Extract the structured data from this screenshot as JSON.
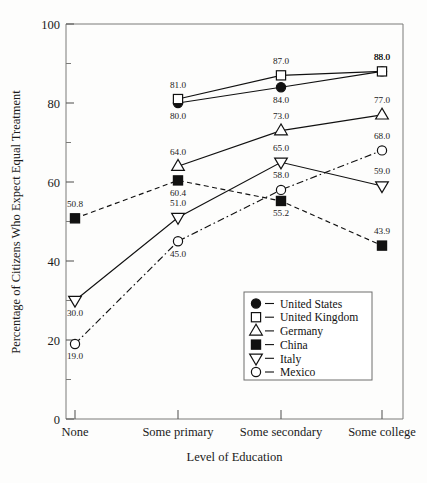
{
  "chart_data": {
    "type": "line",
    "title": "",
    "xlabel": "Level of Education",
    "ylabel": "Percentage of Citizens Who Expect Equal Treatment",
    "categories": [
      "None",
      "Some primary",
      "Some secondary",
      "Some college"
    ],
    "ylim": [
      0,
      100
    ],
    "yticks": [
      0,
      20,
      40,
      60,
      80,
      100
    ],
    "yticks_minor": [
      10,
      30,
      50,
      70,
      90
    ],
    "grid": false,
    "legend_position": "center-right-inside",
    "series": [
      {
        "name": "United States",
        "marker": "filled-circle",
        "line_style": "solid",
        "values": [
          null,
          80.0,
          84.0,
          88.0
        ],
        "labels": [
          "",
          "80.0",
          "84.0",
          "88.0"
        ],
        "label_positions": [
          "",
          "below",
          "below",
          "above"
        ]
      },
      {
        "name": "United Kingdom",
        "marker": "open-square",
        "line_style": "solid",
        "values": [
          null,
          81.0,
          87.0,
          88.0
        ],
        "labels": [
          "",
          "81.0",
          "87.0",
          "88.0"
        ],
        "label_positions": [
          "",
          "above",
          "above",
          "above"
        ]
      },
      {
        "name": "Germany",
        "marker": "open-triangle-up",
        "line_style": "solid",
        "values": [
          null,
          64.0,
          73.0,
          77.0
        ],
        "labels": [
          "",
          "64.0",
          "73.0",
          "77.0"
        ],
        "label_positions": [
          "",
          "above",
          "above",
          "above"
        ]
      },
      {
        "name": "China",
        "marker": "filled-square",
        "line_style": "dashed",
        "values": [
          50.8,
          60.4,
          55.2,
          43.9
        ],
        "labels": [
          "50.8",
          "60.4",
          "55.2",
          "43.9"
        ],
        "label_positions": [
          "above",
          "below",
          "below",
          "above"
        ]
      },
      {
        "name": "Italy",
        "marker": "open-triangle-down",
        "line_style": "solid",
        "values": [
          30.0,
          51.0,
          65.0,
          59.0
        ],
        "labels": [
          "30.0",
          "51.0",
          "65.0",
          "59.0"
        ],
        "label_positions": [
          "below",
          "above",
          "above",
          "above"
        ]
      },
      {
        "name": "Mexico",
        "marker": "open-circle",
        "line_style": "dashdot",
        "values": [
          19.0,
          45.0,
          58.0,
          68.0
        ],
        "labels": [
          "19.0",
          "45.0",
          "58.0",
          "68.0"
        ],
        "label_positions": [
          "below",
          "below",
          "above",
          "above"
        ]
      }
    ]
  }
}
